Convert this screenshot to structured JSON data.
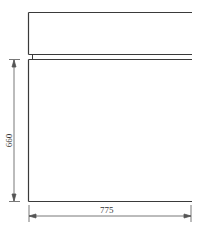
{
  "diagram": {
    "type": "technical-drawing",
    "stroke_color": "#3a3a3a",
    "dimension_color": "#555555",
    "upper_box": {
      "description": "upper panel, open on right side"
    },
    "lower_box": {
      "description": "lower panel, open on right side"
    },
    "dimensions": {
      "height": {
        "value": "660",
        "orientation": "vertical"
      },
      "width": {
        "value": "775",
        "orientation": "horizontal"
      }
    }
  }
}
